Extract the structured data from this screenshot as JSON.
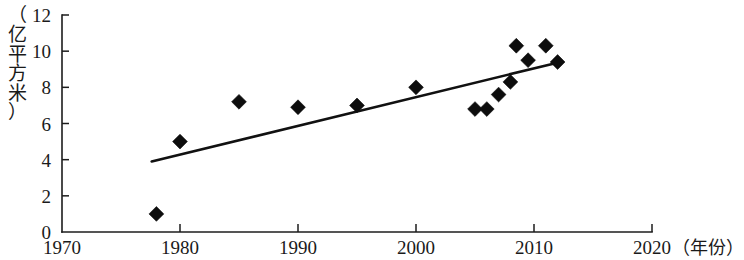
{
  "chart_data": {
    "type": "scatter",
    "title": "",
    "subtitle": "",
    "xlabel": "（年份）",
    "ylabel": "（亿平方米）",
    "ylabel_chars": [
      "（",
      "亿",
      "平",
      "方",
      "米",
      "）"
    ],
    "xlim": [
      1970,
      2020
    ],
    "ylim": [
      0,
      12
    ],
    "xticks": [
      1970,
      1980,
      1990,
      2000,
      2010,
      2020
    ],
    "xtick_labels": [
      "1970",
      "1980",
      "1990",
      "2000",
      "2010",
      "2020"
    ],
    "yticks": [
      0,
      2,
      4,
      6,
      8,
      10,
      12
    ],
    "ytick_labels": [
      "0",
      "2",
      "4",
      "6",
      "8",
      "10",
      "12"
    ],
    "grid": false,
    "legend": null,
    "marker_shape": "diamond",
    "marker_color": "#0d0d0d",
    "x": [
      1978,
      1980,
      1985,
      1990,
      1995,
      2000,
      2005,
      2006,
      2007,
      2008,
      2008.5,
      2009.5,
      2011,
      2012
    ],
    "y": [
      1.0,
      5.0,
      7.2,
      6.9,
      7.0,
      8.0,
      6.8,
      6.8,
      7.6,
      8.3,
      10.3,
      9.5,
      10.3,
      9.4
    ],
    "points": [
      {
        "x": 1978,
        "y": 1.0
      },
      {
        "x": 1980,
        "y": 5.0
      },
      {
        "x": 1985,
        "y": 7.2
      },
      {
        "x": 1990,
        "y": 6.9
      },
      {
        "x": 1995,
        "y": 7.0
      },
      {
        "x": 2000,
        "y": 8.0
      },
      {
        "x": 2005,
        "y": 6.8
      },
      {
        "x": 2006,
        "y": 6.8
      },
      {
        "x": 2007,
        "y": 7.6
      },
      {
        "x": 2008,
        "y": 8.3
      },
      {
        "x": 2008.5,
        "y": 10.3
      },
      {
        "x": 2009.5,
        "y": 9.5
      },
      {
        "x": 2011,
        "y": 10.3
      },
      {
        "x": 2012,
        "y": 9.4
      }
    ],
    "series": [
      {
        "name": "data-points",
        "type": "scatter",
        "values": [
          1.0,
          5.0,
          7.2,
          6.9,
          7.0,
          8.0,
          6.8,
          6.8,
          7.6,
          8.3,
          10.3,
          9.5,
          10.3,
          9.4
        ]
      },
      {
        "name": "trend-line",
        "type": "line",
        "endpoints": [
          {
            "x": 1977.6,
            "y": 3.9
          },
          {
            "x": 2011.9,
            "y": 9.35
          }
        ]
      }
    ],
    "trend_line": {
      "x_start": 1977.6,
      "y_start": 3.9,
      "x_end": 2011.9,
      "y_end": 9.35
    }
  }
}
